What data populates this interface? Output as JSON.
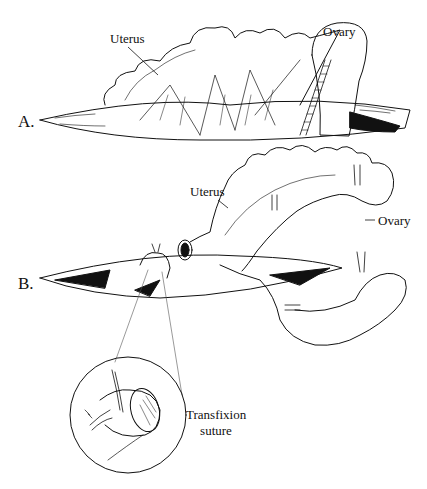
{
  "figure": {
    "panels": [
      {
        "id": "A",
        "label": "A.",
        "annotations": [
          "Uterus",
          "Ovary"
        ]
      },
      {
        "id": "B",
        "label": "B.",
        "annotations": [
          "Uterus",
          "Ovary"
        ]
      }
    ],
    "inset": {
      "annotation_line1": "Transfixion",
      "annotation_line2": "suture"
    }
  }
}
